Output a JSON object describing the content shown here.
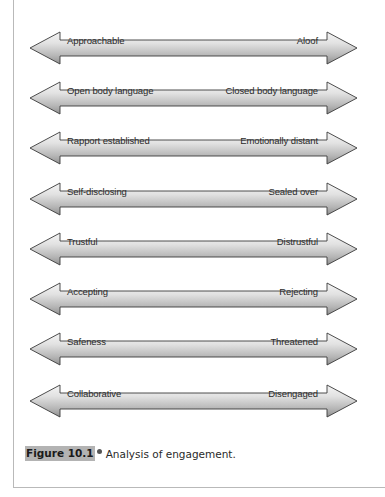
{
  "figure": {
    "caption_label": "Figure 10.1",
    "caption_text": "Analysis of engagement.",
    "colors": {
      "arrow_fill_light": "#f2f2f2",
      "arrow_fill_dark": "#9a9a9a",
      "arrow_outline": "#3a3a3a",
      "caption_highlight": "#b3b3b3",
      "frame_border": "#b9b9b9"
    },
    "rows": [
      {
        "left": "Approachable",
        "right": "Aloof"
      },
      {
        "left": "Open body language",
        "right": "Closed body language"
      },
      {
        "left": "Rapport established",
        "right": "Emotionally distant"
      },
      {
        "left": "Self-disclosing",
        "right": "Sealed over"
      },
      {
        "left": "Trustful",
        "right": "Distrustful"
      },
      {
        "left": "Accepting",
        "right": "Rejecting"
      },
      {
        "left": "Safeness",
        "right": "Threatened"
      },
      {
        "left": "Collaborative",
        "right": "Disengaged"
      }
    ]
  }
}
